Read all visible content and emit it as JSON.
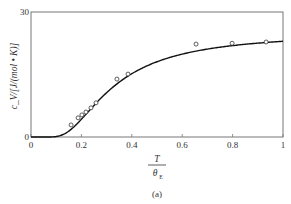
{
  "chart_data": {
    "type": "line",
    "title": "",
    "caption": "(a)",
    "xlabel": "T / θ_E",
    "xlabel_numerator": "T",
    "xlabel_denominator": "θ",
    "xlabel_subscript": "E",
    "ylabel": "c_V/[J/(mol • K)]",
    "xlim": [
      0,
      1
    ],
    "ylim": [
      0,
      30
    ],
    "x_ticks": [
      0,
      0.2,
      0.4,
      0.6,
      0.8,
      1
    ],
    "x_tick_labels": [
      "0",
      "0.2",
      "0.4",
      "0.6",
      "0.8",
      "1"
    ],
    "y_ticks": [
      0,
      30
    ],
    "y_tick_labels": [
      "0",
      "30"
    ],
    "grid": false,
    "legend": null,
    "series": [
      {
        "name": "Einstein model (theory)",
        "style": "solid-line",
        "function": "3R (1/x)^2 e^(1/x) / (e^(1/x)-1)^2",
        "x": [
          0.05,
          0.1,
          0.15,
          0.2,
          0.25,
          0.3,
          0.35,
          0.4,
          0.5,
          0.6,
          0.7,
          0.8,
          0.9,
          1.0
        ],
        "values": [
          0.0,
          0.1,
          1.1,
          3.4,
          7.6,
          10.6,
          13.4,
          15.6,
          18.6,
          20.3,
          21.3,
          21.9,
          22.4,
          22.7
        ]
      },
      {
        "name": "Experimental data",
        "style": "open-circle-markers",
        "x": [
          0.159,
          0.187,
          0.202,
          0.218,
          0.238,
          0.258,
          0.341,
          0.385,
          0.655,
          0.798,
          0.933
        ],
        "values": [
          2.9,
          4.6,
          5.3,
          6.0,
          7.0,
          8.2,
          13.9,
          15.1,
          22.3,
          22.5,
          22.8
        ]
      }
    ]
  }
}
